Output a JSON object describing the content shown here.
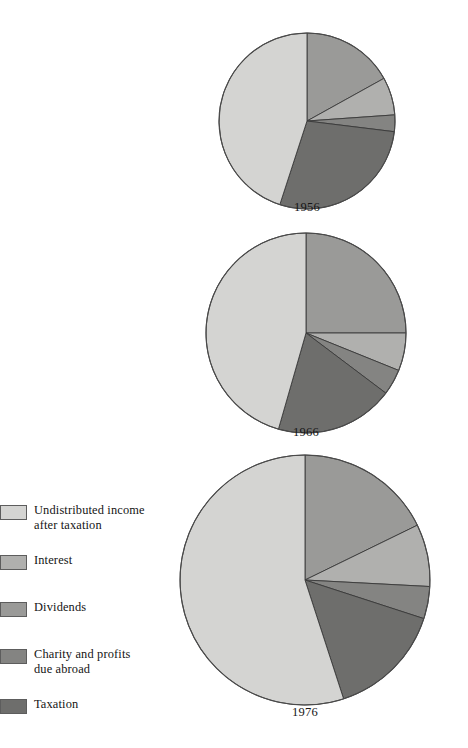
{
  "figure": {
    "title": "",
    "background": "#ffffff"
  },
  "legend": {
    "items": [
      {
        "key": "undistributed",
        "label": "Undistributed income\nafter taxation",
        "color": "#d4d4d2",
        "swatch_name": "legend-swatch-undistributed-income"
      },
      {
        "key": "interest",
        "label": "Interest",
        "color": "#b0b0ae",
        "swatch_name": "legend-swatch-interest"
      },
      {
        "key": "dividends",
        "label": "Dividends",
        "color": "#9a9a98",
        "swatch_name": "legend-swatch-dividends"
      },
      {
        "key": "charity",
        "label": "Charity and profits\ndue abroad",
        "color": "#848482",
        "swatch_name": "legend-swatch-charity"
      },
      {
        "key": "taxation",
        "label": "Taxation",
        "color": "#6e6e6c",
        "swatch_name": "legend-swatch-taxation"
      }
    ]
  },
  "pies": [
    {
      "year": "1956",
      "cx": 307,
      "cy": 121,
      "r": 88,
      "label_top": 201
    },
    {
      "year": "1966",
      "cx": 306,
      "cy": 333,
      "r": 100,
      "label_top": 426
    },
    {
      "year": "1976",
      "cx": 305,
      "cy": 580,
      "r": 125,
      "label_top": 706
    }
  ],
  "chart_data": {
    "type": "pie",
    "title": "",
    "subtitle": "",
    "legend_position": "left",
    "grid": false,
    "units": "percent of total",
    "start_angle_deg": 0,
    "direction": "clockwise",
    "categories": [
      "Dividends",
      "Interest",
      "Charity and profits due abroad",
      "Taxation",
      "Undistributed income after taxation"
    ],
    "colors": [
      "#9a9a98",
      "#b0b0ae",
      "#848482",
      "#6e6e6c",
      "#d4d4d2"
    ],
    "series": [
      {
        "name": "1956",
        "values": [
          17,
          7,
          3,
          28,
          45
        ]
      },
      {
        "name": "1966",
        "values": [
          25,
          6,
          4,
          19,
          46
        ]
      },
      {
        "name": "1976",
        "values": [
          18,
          8,
          4,
          15,
          55
        ]
      }
    ],
    "charts": [
      {
        "name": "1956",
        "radius_px": 88,
        "slices": [
          {
            "label": "Dividends",
            "value": 17,
            "color": "#9a9a98",
            "start_deg": 0,
            "end_deg": 61
          },
          {
            "label": "Interest",
            "value": 7,
            "color": "#b0b0ae",
            "start_deg": 61,
            "end_deg": 86
          },
          {
            "label": "Charity and profits due abroad",
            "value": 3,
            "color": "#848482",
            "start_deg": 86,
            "end_deg": 97
          },
          {
            "label": "Taxation",
            "value": 28,
            "color": "#6e6e6c",
            "start_deg": 97,
            "end_deg": 198
          },
          {
            "label": "Undistributed income after taxation",
            "value": 45,
            "color": "#d4d4d2",
            "start_deg": 198,
            "end_deg": 360
          }
        ]
      },
      {
        "name": "1966",
        "radius_px": 100,
        "slices": [
          {
            "label": "Dividends",
            "value": 25,
            "color": "#9a9a98",
            "start_deg": 0,
            "end_deg": 90
          },
          {
            "label": "Interest",
            "value": 6,
            "color": "#b0b0ae",
            "start_deg": 90,
            "end_deg": 112
          },
          {
            "label": "Charity and profits due abroad",
            "value": 4,
            "color": "#848482",
            "start_deg": 112,
            "end_deg": 127
          },
          {
            "label": "Taxation",
            "value": 19,
            "color": "#6e6e6c",
            "start_deg": 127,
            "end_deg": 196
          },
          {
            "label": "Undistributed income after taxation",
            "value": 46,
            "color": "#d4d4d2",
            "start_deg": 196,
            "end_deg": 360
          }
        ]
      },
      {
        "name": "1976",
        "radius_px": 125,
        "slices": [
          {
            "label": "Dividends",
            "value": 18,
            "color": "#9a9a98",
            "start_deg": 0,
            "end_deg": 64
          },
          {
            "label": "Interest",
            "value": 8,
            "color": "#b0b0ae",
            "start_deg": 64,
            "end_deg": 93
          },
          {
            "label": "Charity and profits due abroad",
            "value": 4,
            "color": "#848482",
            "start_deg": 93,
            "end_deg": 108
          },
          {
            "label": "Taxation",
            "value": 15,
            "color": "#6e6e6c",
            "start_deg": 108,
            "end_deg": 162
          },
          {
            "label": "Undistributed income after taxation",
            "value": 55,
            "color": "#d4d4d2",
            "start_deg": 162,
            "end_deg": 360
          }
        ]
      }
    ]
  }
}
